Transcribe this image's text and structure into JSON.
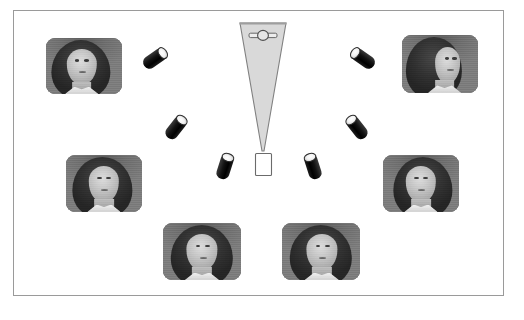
{
  "figure": {
    "background_color": "#ffffff",
    "frame": {
      "name": "figure-border",
      "border_color": "#9a9a9a",
      "fill_color": "#ffffff"
    }
  },
  "observer": {
    "cone": {
      "label": "view-frustum",
      "fill_color": "#d9d9d9",
      "stroke_color": "#808080",
      "top_left_x": 240,
      "top_right_x": 286,
      "top_y": 23,
      "apex_x": 263,
      "apex_y": 152
    },
    "eye_symbol": {
      "label": "eye-icon",
      "fill_color": "#e8e8e8",
      "stroke_color": "#555555",
      "cx": 263,
      "cy": 36
    },
    "target": {
      "label": "target-object",
      "fill_color": "#ffffff",
      "stroke_color": "#6b6b6b",
      "x": 255,
      "y": 154,
      "width": 17,
      "height": 22
    }
  },
  "cameras": [
    {
      "id": "camera-1",
      "position": "upper-left",
      "x": 142,
      "y": 52,
      "rotation": -35,
      "lens_side": "right",
      "body_color": "#0b0b0b",
      "lens_color": "#f2f2f2"
    },
    {
      "id": "camera-2",
      "position": "mid-left",
      "x": 163,
      "y": 121,
      "rotation": -52,
      "lens_side": "right",
      "body_color": "#0b0b0b",
      "lens_color": "#f2f2f2"
    },
    {
      "id": "camera-3",
      "position": "lower-left",
      "x": 212,
      "y": 160,
      "rotation": -72,
      "lens_side": "right",
      "body_color": "#0b0b0b",
      "lens_color": "#f2f2f2"
    },
    {
      "id": "camera-4",
      "position": "lower-right",
      "x": 300,
      "y": 160,
      "rotation": 72,
      "lens_side": "left",
      "body_color": "#0b0b0b",
      "lens_color": "#f2f2f2"
    },
    {
      "id": "camera-5",
      "position": "mid-right",
      "x": 344,
      "y": 121,
      "rotation": 52,
      "lens_side": "left",
      "body_color": "#0b0b0b",
      "lens_color": "#f2f2f2"
    },
    {
      "id": "camera-6",
      "position": "upper-right",
      "x": 350,
      "y": 52,
      "rotation": 35,
      "lens_side": "left",
      "body_color": "#0b0b0b",
      "lens_color": "#f2f2f2"
    }
  ],
  "photos": [
    {
      "id": "photo-1",
      "position": "top-left",
      "view": "three-quarter-left",
      "x": 46,
      "y": 38,
      "width": 76,
      "height": 56,
      "frame_color": "#8d8d8d"
    },
    {
      "id": "photo-2",
      "position": "top-right",
      "view": "profile-right",
      "x": 402,
      "y": 35,
      "width": 76,
      "height": 58,
      "frame_color": "#8d8d8d"
    },
    {
      "id": "photo-3",
      "position": "mid-left",
      "view": "three-quarter-left",
      "x": 66,
      "y": 155,
      "width": 76,
      "height": 57,
      "frame_color": "#8d8d8d"
    },
    {
      "id": "photo-4",
      "position": "mid-right",
      "view": "three-quarter-right",
      "x": 383,
      "y": 155,
      "width": 76,
      "height": 57,
      "frame_color": "#8d8d8d"
    },
    {
      "id": "photo-5",
      "position": "bottom-left",
      "view": "frontal",
      "x": 163,
      "y": 223,
      "width": 78,
      "height": 57,
      "frame_color": "#8d8d8d"
    },
    {
      "id": "photo-6",
      "position": "bottom-right",
      "view": "frontal",
      "x": 282,
      "y": 223,
      "width": 78,
      "height": 57,
      "frame_color": "#8d8d8d"
    }
  ]
}
